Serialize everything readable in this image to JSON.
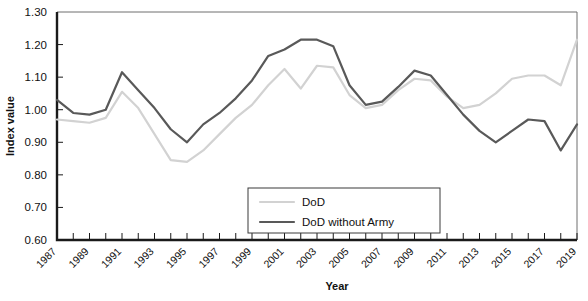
{
  "chart_data": {
    "type": "line",
    "title": "",
    "xlabel": "Year",
    "ylabel": "Index value",
    "ylim": [
      0.6,
      1.3
    ],
    "ytick_labels": [
      "0.60",
      "0.70",
      "0.80",
      "0.90",
      "1.00",
      "1.10",
      "1.20",
      "1.30"
    ],
    "ytick_values": [
      0.6,
      0.7,
      0.8,
      0.9,
      1.0,
      1.1,
      1.2,
      1.3
    ],
    "xlim": [
      1987,
      2019
    ],
    "x": [
      1987,
      1988,
      1989,
      1990,
      1991,
      1992,
      1993,
      1994,
      1995,
      1996,
      1997,
      1998,
      1999,
      2000,
      2001,
      2002,
      2003,
      2004,
      2005,
      2006,
      2007,
      2008,
      2009,
      2010,
      2011,
      2012,
      2013,
      2014,
      2015,
      2016,
      2017,
      2018,
      2019
    ],
    "xtick_labels": [
      "1987",
      "1989",
      "1991",
      "1993",
      "1995",
      "1997",
      "1999",
      "2001",
      "2003",
      "2005",
      "2007",
      "2009",
      "2011",
      "2013",
      "2015",
      "2017",
      "2019"
    ],
    "xtick_values": [
      1987,
      1989,
      1991,
      1993,
      1995,
      1997,
      1999,
      2001,
      2003,
      2005,
      2007,
      2009,
      2011,
      2013,
      2015,
      2017,
      2019
    ],
    "grid": false,
    "legend_position": "lower-center",
    "series": [
      {
        "name": "DoD",
        "color": "#d2d2d2",
        "width": 2.2,
        "values": [
          0.97,
          0.965,
          0.96,
          0.975,
          1.055,
          1.005,
          0.925,
          0.845,
          0.84,
          0.875,
          0.925,
          0.975,
          1.015,
          1.075,
          1.125,
          1.065,
          1.135,
          1.13,
          1.045,
          1.005,
          1.015,
          1.06,
          1.095,
          1.09,
          1.04,
          1.005,
          1.015,
          1.05,
          1.095,
          1.105,
          1.105,
          1.075,
          1.215
        ]
      },
      {
        "name": "DoD without Army",
        "color": "#595959",
        "width": 2.2,
        "values": [
          1.03,
          0.99,
          0.985,
          1.0,
          1.115,
          1.06,
          1.005,
          0.94,
          0.9,
          0.955,
          0.99,
          1.035,
          1.09,
          1.165,
          1.185,
          1.215,
          1.215,
          1.195,
          1.075,
          1.015,
          1.025,
          1.07,
          1.12,
          1.105,
          1.045,
          0.985,
          0.935,
          0.9,
          0.935,
          0.97,
          0.965,
          0.875,
          0.955
        ]
      }
    ]
  },
  "legend": {
    "entries": [
      {
        "label": "DoD"
      },
      {
        "label": "DoD without Army"
      }
    ]
  }
}
